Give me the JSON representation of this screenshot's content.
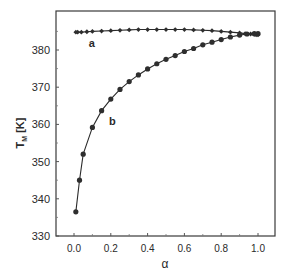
{
  "chart_data": {
    "type": "line",
    "title": "",
    "xlabel": "α",
    "ylabel": "T",
    "ylabel_subscript": "M",
    "ylabel_unit": "[K]",
    "xlim": [
      -0.1,
      1.1
    ],
    "ylim": [
      330,
      390
    ],
    "x_ticks": [
      0.0,
      0.2,
      0.4,
      0.6,
      0.8,
      1.0
    ],
    "x_tick_labels": [
      "0.0",
      "0.2",
      "0.4",
      "0.6",
      "0.8",
      "1.0"
    ],
    "y_ticks": [
      330,
      340,
      350,
      360,
      370,
      380
    ],
    "y_tick_labels": [
      "330",
      "340",
      "350",
      "360",
      "370",
      "380"
    ],
    "grid": false,
    "legend": "none (inline curve labels)",
    "series": [
      {
        "name": "a",
        "marker": "diamond",
        "x": [
          0.01,
          0.02,
          0.04,
          0.07,
          0.1,
          0.15,
          0.2,
          0.25,
          0.3,
          0.35,
          0.4,
          0.45,
          0.5,
          0.55,
          0.6,
          0.65,
          0.7,
          0.75,
          0.8,
          0.85,
          0.9,
          0.93,
          0.96,
          0.98,
          0.99,
          1.0
        ],
        "y": [
          384.8,
          384.8,
          384.8,
          384.9,
          385.0,
          385.1,
          385.2,
          385.3,
          385.4,
          385.5,
          385.5,
          385.5,
          385.5,
          385.5,
          385.5,
          385.4,
          385.3,
          385.2,
          385.0,
          384.8,
          384.6,
          384.4,
          384.3,
          384.2,
          384.1,
          384.1
        ],
        "label_position": {
          "alpha": 0.08,
          "T": 382
        }
      },
      {
        "name": "b",
        "marker": "circle",
        "x": [
          0.01,
          0.03,
          0.05,
          0.1,
          0.15,
          0.2,
          0.25,
          0.3,
          0.35,
          0.4,
          0.45,
          0.5,
          0.55,
          0.6,
          0.65,
          0.7,
          0.75,
          0.8,
          0.85,
          0.9,
          0.94,
          0.98,
          1.0
        ],
        "y": [
          336.5,
          345.0,
          352.0,
          359.2,
          363.7,
          366.8,
          369.4,
          371.5,
          373.3,
          374.9,
          376.3,
          377.5,
          378.5,
          379.6,
          380.4,
          381.4,
          382.1,
          382.8,
          383.5,
          384.0,
          384.3,
          384.4,
          384.4
        ],
        "label_position": {
          "alpha": 0.19,
          "T": 361
        }
      }
    ]
  },
  "labels": {
    "curve_a": "a",
    "curve_b": "b",
    "x_axis": "α",
    "y_axis_main": "T",
    "y_axis_sub": "M",
    "y_axis_unit": "[K]"
  }
}
